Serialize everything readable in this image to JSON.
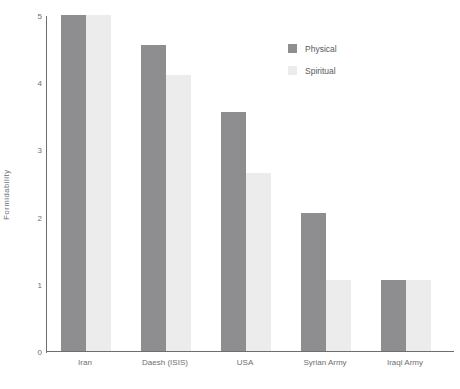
{
  "top_strip_text": "",
  "chart_data": {
    "type": "bar",
    "title": "",
    "xlabel": "",
    "ylabel": "Formidability",
    "ylim": [
      0,
      5
    ],
    "yticks": [
      5,
      4,
      3,
      2,
      1,
      0
    ],
    "grid": false,
    "legend_position": "top-right",
    "categories": [
      "Iran",
      "Daesh (ISIS)",
      "USA",
      "Syrian Army",
      "Iraqi Army"
    ],
    "series": [
      {
        "name": "Physical",
        "color": "#8e8e90",
        "values": [
          5.0,
          4.55,
          3.55,
          2.05,
          1.05
        ]
      },
      {
        "name": "Spiritual",
        "color": "#ececed",
        "values": [
          5.0,
          4.1,
          2.65,
          1.05,
          1.05
        ]
      }
    ]
  },
  "legend": {
    "items": [
      {
        "label": "Physical",
        "color": "#8e8e90"
      },
      {
        "label": "Spiritual",
        "color": "#ececed"
      }
    ]
  },
  "axis": {
    "y_title": "Formidability",
    "y_tick_labels": [
      "5",
      "4",
      "3",
      "2",
      "1",
      "0"
    ]
  }
}
